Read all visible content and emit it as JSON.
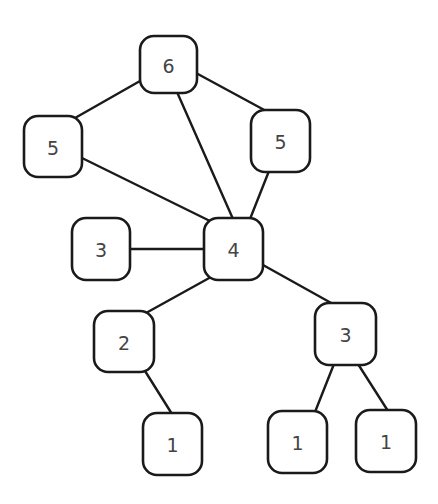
{
  "diagram": {
    "type": "graph",
    "style": {
      "stroke_color": "#1a1a1a",
      "label_color": "#444444",
      "background": "#ffffff",
      "node_radius": 14
    },
    "nodes": [
      {
        "id": "n6",
        "label": "6",
        "x": 140,
        "y": 36,
        "w": 57,
        "h": 57
      },
      {
        "id": "n5a",
        "label": "5",
        "x": 24,
        "y": 116,
        "w": 58,
        "h": 61
      },
      {
        "id": "n5b",
        "label": "5",
        "x": 251,
        "y": 110,
        "w": 59,
        "h": 62
      },
      {
        "id": "n3a",
        "label": "3",
        "x": 72,
        "y": 218,
        "w": 58,
        "h": 62
      },
      {
        "id": "n4",
        "label": "4",
        "x": 204,
        "y": 218,
        "w": 59,
        "h": 62
      },
      {
        "id": "n2",
        "label": "2",
        "x": 94,
        "y": 311,
        "w": 60,
        "h": 61
      },
      {
        "id": "n3b",
        "label": "3",
        "x": 315,
        "y": 303,
        "w": 61,
        "h": 62
      },
      {
        "id": "n1a",
        "label": "1",
        "x": 143,
        "y": 413,
        "w": 59,
        "h": 62
      },
      {
        "id": "n1b",
        "label": "1",
        "x": 268,
        "y": 411,
        "w": 59,
        "h": 62
      },
      {
        "id": "n1c",
        "label": "1",
        "x": 356,
        "y": 410,
        "w": 60,
        "h": 62
      }
    ],
    "edges": [
      {
        "from": "n6",
        "to": "n5a",
        "x1": 140,
        "y1": 81,
        "x2": 75,
        "y2": 118
      },
      {
        "from": "n6",
        "to": "n5b",
        "x1": 196,
        "y1": 73,
        "x2": 268,
        "y2": 112
      },
      {
        "from": "n6",
        "to": "n4",
        "x1": 177,
        "y1": 92,
        "x2": 233,
        "y2": 219
      },
      {
        "from": "n5a",
        "to": "n4",
        "x1": 82,
        "y1": 158,
        "x2": 212,
        "y2": 222
      },
      {
        "from": "n5b",
        "to": "n4",
        "x1": 269,
        "y1": 171,
        "x2": 250,
        "y2": 219
      },
      {
        "from": "n3a",
        "to": "n4",
        "x1": 130,
        "y1": 249,
        "x2": 204,
        "y2": 249
      },
      {
        "from": "n4",
        "to": "n2",
        "x1": 211,
        "y1": 277,
        "x2": 146,
        "y2": 313
      },
      {
        "from": "n4",
        "to": "n3b",
        "x1": 263,
        "y1": 265,
        "x2": 333,
        "y2": 304
      },
      {
        "from": "n2",
        "to": "n1a",
        "x1": 145,
        "y1": 371,
        "x2": 172,
        "y2": 414
      },
      {
        "from": "n3b",
        "to": "n1b",
        "x1": 334,
        "y1": 364,
        "x2": 315,
        "y2": 412
      },
      {
        "from": "n3b",
        "to": "n1c",
        "x1": 358,
        "y1": 364,
        "x2": 388,
        "y2": 411
      }
    ]
  }
}
